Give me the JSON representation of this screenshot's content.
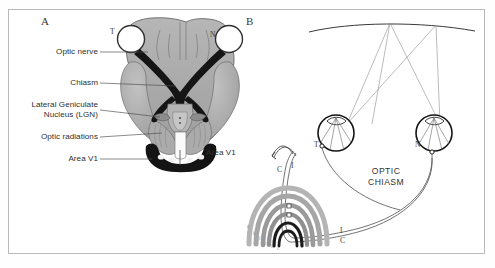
{
  "figure": {
    "background_color": "#ffffff",
    "frame_color": "#b9b9b9",
    "panels": [
      {
        "letter": "A",
        "name": "inferior-view-of-brain-visual-pathway"
      },
      {
        "letter": "B",
        "name": "schematic-visual-field-projection"
      }
    ]
  },
  "panel_a": {
    "letter": "A",
    "callouts": [
      {
        "id": "optic-nerve",
        "text": "Optic nerve"
      },
      {
        "id": "chiasm",
        "text": "Chiasm"
      },
      {
        "id": "lgn",
        "text": "Lateral Geniculate\nNucleus (LGN)"
      },
      {
        "id": "optic-radiations",
        "text": "Optic radiations"
      },
      {
        "id": "area-v1",
        "text": "Area V1"
      }
    ],
    "eye_markers": [
      {
        "id": "temporal-left",
        "text": "T"
      },
      {
        "id": "nasal-right",
        "text": "N"
      }
    ],
    "colors": {
      "brain_fill": "#a8a8a8",
      "brain_fill_light": "#bfbfbf",
      "nerve_dark": "#1a1a1a",
      "outline": "#4a4a4a"
    }
  },
  "panel_b": {
    "letter": "B",
    "optic_chiasm_label": "OPTIC\nCHIASM",
    "area_v1_label": "Area V1",
    "eye_markers": [
      {
        "id": "left-eye-temporal",
        "text": "T"
      },
      {
        "id": "right-eye-nasal",
        "text": "N"
      }
    ],
    "pathway_markers": [
      {
        "id": "v1-contralateral",
        "text": "C"
      },
      {
        "id": "v1-ipsilateral",
        "text": "I"
      },
      {
        "id": "tract-ipsilateral",
        "text": "I"
      },
      {
        "id": "tract-contralateral",
        "text": "C"
      }
    ],
    "arc_markers": [
      {
        "id": "arc-c-outer",
        "text": "c"
      },
      {
        "id": "arc-i-1",
        "text": "i"
      },
      {
        "id": "arc-i-2",
        "text": "i"
      },
      {
        "id": "arc-c-1",
        "text": "c"
      },
      {
        "id": "arc-i-3",
        "text": "i"
      },
      {
        "id": "arc-c-2",
        "text": "c"
      }
    ],
    "colors": {
      "ray_line": "#8f8f8f",
      "eye_outline": "#1c1c1c",
      "arc_gray": "#b0b0b0",
      "arc_gray_mid": "#9a9a9a",
      "arc_black": "#111111",
      "tract_line": "#4f4f4f"
    }
  }
}
